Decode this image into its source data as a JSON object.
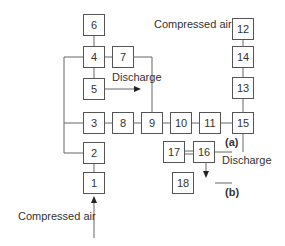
{
  "diagram": {
    "boxes": {
      "b1": "1",
      "b2": "2",
      "b3": "3",
      "b4": "4",
      "b5": "5",
      "b6": "6",
      "b7": "7",
      "b8": "8",
      "b9": "9",
      "b10": "10",
      "b11": "11",
      "b12": "12",
      "b13": "13",
      "b14": "14",
      "b15": "15",
      "b16": "16",
      "b17": "17",
      "b18": "18"
    },
    "labels": {
      "compressed_air_top": "Compressed air",
      "compressed_air_bottom": "Compressed air",
      "discharge_left": "Discharge",
      "discharge_right": "Discharge",
      "part_a": "(a)",
      "part_b": "(b)"
    },
    "line_color": "#666666"
  }
}
